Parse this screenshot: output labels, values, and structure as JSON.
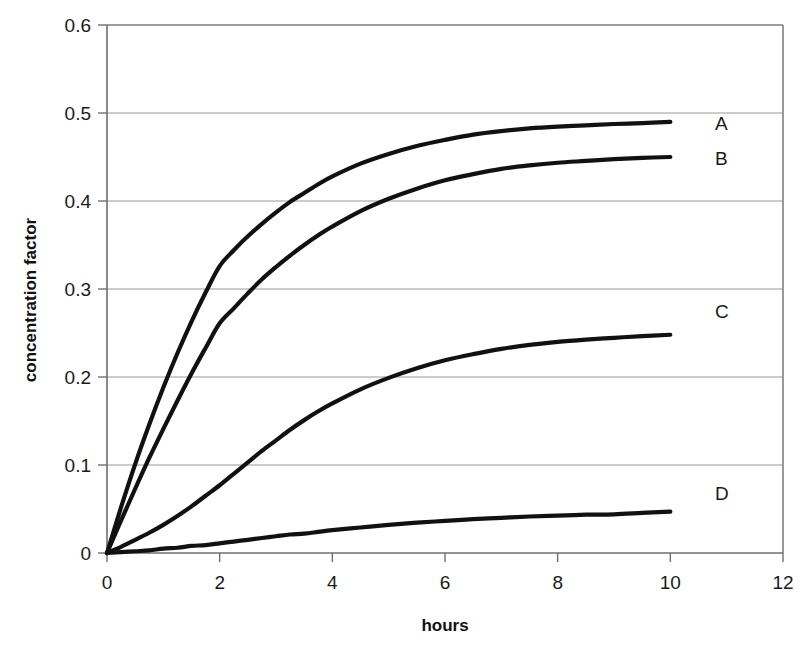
{
  "chart_data": {
    "type": "line",
    "title": "",
    "xlabel": "hours",
    "ylabel": "concentration factor",
    "xlim": [
      0,
      12
    ],
    "ylim": [
      0,
      0.6
    ],
    "xticks": [
      "0",
      "2",
      "4",
      "6",
      "8",
      "10",
      "12"
    ],
    "xtick_values": [
      0,
      2,
      4,
      6,
      8,
      10,
      12
    ],
    "yticks": [
      "0",
      "0.1",
      "0.2",
      "0.3",
      "0.4",
      "0.5",
      "0.6"
    ],
    "ytick_values": [
      0,
      0.1,
      0.2,
      0.3,
      0.4,
      0.5,
      0.6
    ],
    "grid": "horizontal",
    "legend_position": "right-inline",
    "line_color": "#111111",
    "grid_color": "#9a9a9a",
    "axis_color": "#6f6f6f",
    "x": [
      0,
      0.25,
      0.5,
      0.75,
      1,
      1.25,
      1.5,
      1.75,
      2,
      2.25,
      2.5,
      2.75,
      3,
      3.25,
      3.5,
      3.75,
      4,
      4.5,
      5,
      5.5,
      6,
      6.5,
      7,
      7.5,
      8,
      8.5,
      9,
      9.5,
      10
    ],
    "series": [
      {
        "name": "A",
        "label": "A",
        "end_value": 0.49,
        "values": [
          0,
          0.052,
          0.101,
          0.146,
          0.188,
          0.227,
          0.263,
          0.296,
          0.326,
          0.344,
          0.36,
          0.374,
          0.387,
          0.399,
          0.409,
          0.419,
          0.428,
          0.4425,
          0.4535,
          0.4625,
          0.4695,
          0.4755,
          0.4795,
          0.4825,
          0.4845,
          0.486,
          0.4875,
          0.4885,
          0.49
        ]
      },
      {
        "name": "B",
        "label": "B",
        "end_value": 0.45,
        "values": [
          0,
          0.037,
          0.073,
          0.108,
          0.141,
          0.173,
          0.204,
          0.233,
          0.261,
          0.278,
          0.295,
          0.311,
          0.325,
          0.338,
          0.35,
          0.361,
          0.371,
          0.3885,
          0.4025,
          0.414,
          0.4235,
          0.4305,
          0.4365,
          0.4405,
          0.4435,
          0.4455,
          0.4475,
          0.449,
          0.45
        ]
      },
      {
        "name": "C",
        "label": "C",
        "end_value": 0.248,
        "values": [
          0,
          0.007,
          0.015,
          0.023,
          0.032,
          0.042,
          0.053,
          0.065,
          0.077,
          0.09,
          0.103,
          0.116,
          0.128,
          0.14,
          0.151,
          0.161,
          0.17,
          0.186,
          0.199,
          0.21,
          0.219,
          0.226,
          0.232,
          0.2365,
          0.24,
          0.2425,
          0.2445,
          0.2465,
          0.248
        ]
      },
      {
        "name": "D",
        "label": "D",
        "end_value": 0.047,
        "values": [
          0,
          0.001,
          0.002,
          0.003,
          0.005,
          0.006,
          0.008,
          0.009,
          0.011,
          0.013,
          0.015,
          0.017,
          0.019,
          0.021,
          0.022,
          0.024,
          0.026,
          0.029,
          0.032,
          0.0345,
          0.0365,
          0.0385,
          0.04,
          0.0415,
          0.0425,
          0.0435,
          0.044,
          0.0455,
          0.047
        ]
      }
    ]
  },
  "labels": {
    "series_A": "A",
    "series_B": "B",
    "series_C": "C",
    "series_D": "D"
  }
}
